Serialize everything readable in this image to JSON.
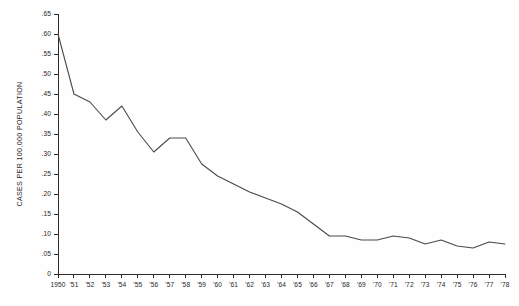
{
  "chart_data": {
    "type": "line",
    "title": "",
    "xlabel": "",
    "ylabel": "CASES PER 100,000 POPULATION",
    "xlim": [
      1950,
      1978
    ],
    "ylim": [
      0,
      0.65
    ],
    "grid": false,
    "legend": "none",
    "y_ticks": [
      0,
      0.05,
      0.1,
      0.15,
      0.2,
      0.25,
      0.3,
      0.35,
      0.4,
      0.45,
      0.5,
      0.55,
      0.6,
      0.65
    ],
    "y_tick_labels": [
      "0",
      ".05",
      ".10",
      ".15",
      ".20",
      ".25",
      ".30",
      ".35",
      ".40",
      ".45",
      ".50",
      ".55",
      ".60",
      ".65"
    ],
    "x": [
      1950,
      1951,
      1952,
      1953,
      1954,
      1955,
      1956,
      1957,
      1958,
      1959,
      1960,
      1961,
      1962,
      1963,
      1964,
      1965,
      1966,
      1967,
      1968,
      1969,
      1970,
      1971,
      1972,
      1973,
      1974,
      1975,
      1976,
      1977,
      1978
    ],
    "x_tick_labels": [
      "1950",
      "'51",
      "'52",
      "'53",
      "'54",
      "'55",
      "'56",
      "'57",
      "'58",
      "'59",
      "'60",
      "'61",
      "'62",
      "'63",
      "'64",
      "'65",
      "'66",
      "'67",
      "'68",
      "'69",
      "'70",
      "'71",
      "'72",
      "'73",
      "'74",
      "'75",
      "'76",
      "'77",
      "'78"
    ],
    "values": [
      0.6,
      0.45,
      0.43,
      0.385,
      0.42,
      0.355,
      0.305,
      0.34,
      0.34,
      0.275,
      0.245,
      0.225,
      0.205,
      0.19,
      0.175,
      0.155,
      0.125,
      0.095,
      0.095,
      0.085,
      0.085,
      0.095,
      0.09,
      0.075,
      0.085,
      0.07,
      0.065,
      0.08,
      0.075
    ],
    "series_name": "Cases per 100,000 population"
  },
  "colors": {
    "line": "#4a4a4a",
    "axis": "#2b2b2b",
    "text": "#262626",
    "background": "#fefefe"
  }
}
